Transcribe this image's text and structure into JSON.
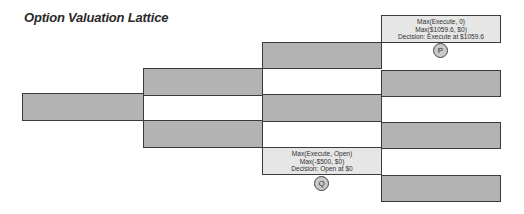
{
  "title": "Option Valuation Lattice",
  "colors": {
    "node_fill": "#b3b3b3",
    "highlight_fill": "#e6e6e6",
    "border": "#3a3a3a"
  },
  "lattice": {
    "levels": [
      {
        "step": 0,
        "nodes": [
          {
            "id": "n0_0"
          }
        ]
      },
      {
        "step": 1,
        "nodes": [
          {
            "id": "n1_0"
          },
          {
            "id": "n1_1"
          }
        ]
      },
      {
        "step": 2,
        "nodes": [
          {
            "id": "n2_0"
          },
          {
            "id": "n2_1"
          },
          {
            "id": "n2_2"
          }
        ]
      },
      {
        "step": 3,
        "nodes": [
          {
            "id": "n3_0"
          },
          {
            "id": "n3_1"
          },
          {
            "id": "n3_2"
          },
          {
            "id": "n3_3"
          }
        ]
      }
    ]
  },
  "callouts": {
    "p": {
      "marker": "P",
      "line1": "Max(Execute, 0)",
      "line2": "Max($1059.6, $0)",
      "line3": "Decision: Execute at $1059.6"
    },
    "q": {
      "marker": "Q",
      "line1": "Max(Execute, Open)",
      "line2": "Max(-$500, $0)",
      "line3": "Decision: Open at $0"
    }
  }
}
